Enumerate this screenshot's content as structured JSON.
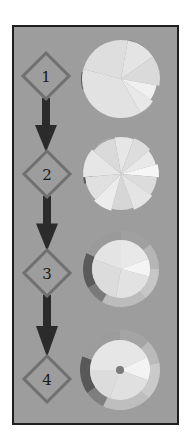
{
  "diagram": {
    "title": "",
    "colors": {
      "background": "#ffffff",
      "frame_fill": "#9d9d9d",
      "frame_border": "#1e1e1e",
      "diamond_stroke": "#707070",
      "arrow": "#2b2b2b",
      "label": "#1a1a1a"
    },
    "steps": [
      {
        "label": "1",
        "diamond": {
          "cx": 46,
          "cy": 76
        },
        "circle": {
          "cx": 121,
          "cy": 79,
          "r": 39,
          "ring": 0,
          "center_dot": false,
          "wedges": [
            {
              "start": -80,
              "end": -35,
              "r": 39,
              "color": "#e4e4e4"
            },
            {
              "start": -35,
              "end": 10,
              "r": 39,
              "color": "#dadada"
            },
            {
              "start": 10,
              "end": 35,
              "r": 36,
              "color": "#f0f0f0"
            },
            {
              "start": 35,
              "end": 60,
              "r": 39,
              "color": "#e8e8e8"
            },
            {
              "start": 60,
              "end": 195,
              "r": 39,
              "color": "#e2e2e2"
            },
            {
              "start": 195,
              "end": 280,
              "r": 39,
              "color": "#dedede"
            }
          ],
          "tabs": [
            {
              "start": -80,
              "end": -55,
              "r0": 30,
              "r1": 40,
              "color": "#8c8c8c"
            },
            {
              "start": 40,
              "end": 55,
              "r0": 30,
              "r1": 40,
              "color": "#a8a8a8"
            },
            {
              "start": 165,
              "end": 190,
              "r0": 30,
              "r1": 40,
              "color": "#5a5a5a"
            }
          ]
        }
      },
      {
        "label": "2",
        "diamond": {
          "cx": 47,
          "cy": 174
        },
        "circle": {
          "cx": 121,
          "cy": 174,
          "r": 38,
          "ring": 0,
          "center_dot": false,
          "wedges": [
            {
              "start": -100,
              "end": -70,
              "r": 37,
              "color": "#e6e6e6"
            },
            {
              "start": -70,
              "end": -40,
              "r": 38,
              "color": "#dddddd"
            },
            {
              "start": -40,
              "end": -15,
              "r": 36,
              "color": "#e9e9e9"
            },
            {
              "start": -15,
              "end": 5,
              "r": 38,
              "color": "#f6f6f6"
            },
            {
              "start": 5,
              "end": 35,
              "r": 36,
              "color": "#dcdcdc"
            },
            {
              "start": 35,
              "end": 70,
              "r": 38,
              "color": "#e4e4e4"
            },
            {
              "start": 70,
              "end": 105,
              "r": 36,
              "color": "#d6d6d6"
            },
            {
              "start": 105,
              "end": 135,
              "r": 38,
              "color": "#ececec"
            },
            {
              "start": 135,
              "end": 175,
              "r": 36,
              "color": "#e0e0e0"
            },
            {
              "start": 175,
              "end": 220,
              "r": 38,
              "color": "#e6e6e6"
            },
            {
              "start": 220,
              "end": 260,
              "r": 36,
              "color": "#dadada"
            }
          ],
          "tabs": [
            {
              "start": -70,
              "end": -45,
              "r0": 30,
              "r1": 38,
              "color": "#9a9a9a"
            },
            {
              "start": -130,
              "end": -105,
              "r0": 30,
              "r1": 38,
              "color": "#a4a4a4"
            },
            {
              "start": 165,
              "end": 190,
              "r0": 29,
              "r1": 38,
              "color": "#555555"
            }
          ]
        }
      },
      {
        "label": "3",
        "diamond": {
          "cx": 47,
          "cy": 273
        },
        "circle": {
          "cx": 121,
          "cy": 269,
          "r": 38,
          "ring": 9,
          "center_dot": false,
          "wedges": [
            {
              "start": -90,
              "end": -20,
              "r": 29,
              "color": "#e8e8e8"
            },
            {
              "start": -20,
              "end": 15,
              "r": 29,
              "color": "#f4f4f4"
            },
            {
              "start": 15,
              "end": 100,
              "r": 29,
              "color": "#e2e2e2"
            },
            {
              "start": 100,
              "end": 200,
              "r": 29,
              "color": "#dcdcdc"
            },
            {
              "start": 200,
              "end": 270,
              "r": 29,
              "color": "#e4e4e4"
            }
          ],
          "tabs": [
            {
              "start": -90,
              "end": -40,
              "r0": 29,
              "r1": 38,
              "color": "#a0a0a0"
            },
            {
              "start": -40,
              "end": 0,
              "r0": 29,
              "r1": 38,
              "color": "#b6b6b6"
            },
            {
              "start": 0,
              "end": 50,
              "r0": 29,
              "r1": 38,
              "color": "#c6c6c6"
            },
            {
              "start": 50,
              "end": 120,
              "r0": 29,
              "r1": 38,
              "color": "#bcbcbc"
            },
            {
              "start": 120,
              "end": 150,
              "r0": 29,
              "r1": 38,
              "color": "#7a7a7a"
            },
            {
              "start": 150,
              "end": 205,
              "r0": 29,
              "r1": 38,
              "color": "#5a5a5a"
            },
            {
              "start": 205,
              "end": 270,
              "r0": 29,
              "r1": 38,
              "color": "#9a9a9a"
            }
          ]
        }
      },
      {
        "label": "4",
        "diamond": {
          "cx": 47,
          "cy": 379
        },
        "circle": {
          "cx": 120,
          "cy": 370,
          "r": 40,
          "ring": 10,
          "center_dot": true,
          "dot_color": "#7a7a7a",
          "wedges": [
            {
              "start": -90,
              "end": -25,
              "r": 30,
              "color": "#e6e6e6"
            },
            {
              "start": -25,
              "end": 20,
              "r": 30,
              "color": "#f3f3f3"
            },
            {
              "start": 20,
              "end": 110,
              "r": 30,
              "color": "#e0e0e0"
            },
            {
              "start": 110,
              "end": 180,
              "r": 30,
              "color": "#dcdcdc"
            },
            {
              "start": 180,
              "end": 270,
              "r": 30,
              "color": "#e6e6e6"
            }
          ],
          "tabs": [
            {
              "start": -90,
              "end": -45,
              "r0": 30,
              "r1": 40,
              "color": "#a4a4a4"
            },
            {
              "start": -45,
              "end": -10,
              "r0": 30,
              "r1": 40,
              "color": "#bababa"
            },
            {
              "start": -10,
              "end": 45,
              "r0": 30,
              "r1": 40,
              "color": "#cacaca"
            },
            {
              "start": 45,
              "end": 115,
              "r0": 30,
              "r1": 40,
              "color": "#bebebe"
            },
            {
              "start": 115,
              "end": 145,
              "r0": 30,
              "r1": 40,
              "color": "#7e7e7e"
            },
            {
              "start": 145,
              "end": 200,
              "r0": 30,
              "r1": 40,
              "color": "#585858"
            },
            {
              "start": 200,
              "end": 270,
              "r0": 30,
              "r1": 40,
              "color": "#9c9c9c"
            }
          ]
        }
      }
    ],
    "arrows": [
      {
        "from": 1,
        "to": 2,
        "x": 46,
        "y1": 98,
        "y2": 152
      },
      {
        "from": 2,
        "to": 3,
        "x": 47,
        "y1": 196,
        "y2": 251
      },
      {
        "from": 3,
        "to": 4,
        "x": 47,
        "y1": 295,
        "y2": 357
      }
    ]
  }
}
